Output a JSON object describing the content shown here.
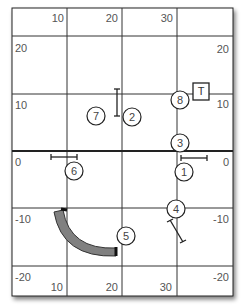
{
  "diagram": {
    "type": "course-map",
    "x_axis": {
      "ticks": [
        10,
        20,
        30
      ],
      "top_labels": [
        "10",
        "20",
        "30"
      ],
      "bottom_labels": [
        "10",
        "20",
        "30"
      ]
    },
    "y_axis": {
      "ticks": [
        20,
        10,
        0,
        -10,
        -20
      ],
      "left_labels": [
        "20",
        "10",
        "0",
        "-10",
        "-20"
      ],
      "right_labels": [
        "20",
        "10",
        "0",
        "-10",
        "-20"
      ]
    },
    "colors": {
      "grid": "#333333",
      "border": "#222222",
      "tunnel_fill": "#808080",
      "tunnel_stroke": "#333333",
      "marker_stroke": "#222222"
    },
    "obstacles": [
      {
        "id": "1",
        "label": "1",
        "kind": "bar-jump",
        "x": 32.5,
        "y": -1
      },
      {
        "id": "2",
        "label": "2",
        "kind": "bar-jump",
        "x": 19,
        "y": 7
      },
      {
        "id": "3",
        "label": "3",
        "kind": "number-marker",
        "x": 30.5,
        "y": 4
      },
      {
        "id": "4",
        "label": "4",
        "kind": "bar-jump",
        "x": 32,
        "y": -10
      },
      {
        "id": "5",
        "label": "5",
        "kind": "tunnel",
        "x": 22,
        "y": -15
      },
      {
        "id": "6",
        "label": "6",
        "kind": "bar-jump",
        "x": 10.5,
        "y": -3.5
      },
      {
        "id": "7",
        "label": "7",
        "kind": "number-marker",
        "x": 13,
        "y": 7
      },
      {
        "id": "8",
        "label": "8",
        "kind": "number-marker",
        "x": 30,
        "y": 10
      }
    ],
    "table": {
      "label": "T"
    }
  }
}
